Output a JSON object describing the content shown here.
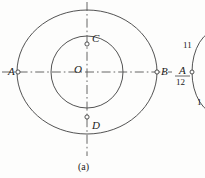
{
  "figure": {
    "caption": "(a)",
    "type": "geometric-line-drawing",
    "center_label": "O",
    "points": [
      {
        "id": "A",
        "label": "A",
        "x": 18,
        "y": 72,
        "on": "outer-circle",
        "marker": "open-dot"
      },
      {
        "id": "B",
        "label": "B",
        "x": 157,
        "y": 72,
        "on": "outer-circle",
        "marker": "open-dot"
      },
      {
        "id": "C",
        "label": "C",
        "x": 87,
        "y": 44,
        "on": "inner-circle",
        "marker": "open-dot"
      },
      {
        "id": "D",
        "label": "D",
        "x": 87,
        "y": 117,
        "on": "inner-circle",
        "marker": "open-dot"
      },
      {
        "id": "O",
        "label": "O",
        "x": 87,
        "y": 72,
        "on": "center",
        "marker": "none"
      }
    ],
    "circles": [
      {
        "id": "outer-circle",
        "cx": 87,
        "cy": 72,
        "rx": 70,
        "ry": 62,
        "stroke": "#3f3f3f"
      },
      {
        "id": "inner-circle",
        "cx": 87,
        "cy": 72,
        "rx": 36,
        "ry": 36,
        "stroke": "#3f3f3f"
      }
    ],
    "center_lines": [
      {
        "id": "horizontal-center-line",
        "x1": 2,
        "y1": 72,
        "x2": 172,
        "y2": 72,
        "style": "dash-dot"
      },
      {
        "id": "vertical-center-line",
        "x1": 87,
        "y1": 2,
        "x2": 87,
        "y2": 156,
        "style": "dash-dot"
      }
    ],
    "colors": {
      "stroke": "#3f3f3f",
      "center_line": "#555555",
      "text": "#1b1b1b",
      "background": "#fdfdfc"
    }
  },
  "partial_figure": {
    "description": "Partially visible clock-face style figure cropped at the right edge.",
    "point_label": "A",
    "numbers": [
      "11",
      "12",
      "1"
    ]
  }
}
